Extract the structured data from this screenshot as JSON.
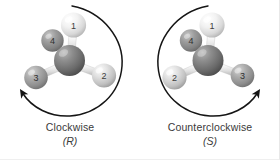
{
  "figure": {
    "background_color": "#ffffff",
    "width": 280,
    "height": 160
  },
  "panels": [
    {
      "id": "R",
      "caption_main": "Clockwise",
      "caption_sub": "(R)",
      "arrow_direction": "clockwise",
      "center_atom": {
        "label": "",
        "color": "#6e6e6e"
      },
      "substituents": [
        {
          "label": "1",
          "position": "top",
          "color": "#e2e2e2"
        },
        {
          "label": "2",
          "position": "lower-right",
          "color": "#c9c9c9"
        },
        {
          "label": "3",
          "position": "lower-left",
          "color": "#9a9a9a"
        },
        {
          "label": "4",
          "position": "upper-left-back",
          "color": "#8c8c8c"
        }
      ]
    },
    {
      "id": "S",
      "caption_main": "Counterclockwise",
      "caption_sub": "(S)",
      "arrow_direction": "counterclockwise",
      "center_atom": {
        "label": "",
        "color": "#6e6e6e"
      },
      "substituents": [
        {
          "label": "1",
          "position": "top",
          "color": "#e2e2e2"
        },
        {
          "label": "2",
          "position": "lower-left",
          "color": "#c9c9c9"
        },
        {
          "label": "3",
          "position": "lower-right",
          "color": "#9a9a9a"
        },
        {
          "label": "4",
          "position": "upper-left-back",
          "color": "#8c8c8c"
        }
      ]
    }
  ],
  "colors": {
    "arrow": "#151515",
    "bond": "#d4d4d4",
    "bond_edge": "#a8a8a8",
    "text": "#3a3a3a",
    "label_text": "#3c3c3c"
  },
  "labels": {
    "r_atom_1": "1",
    "r_atom_2": "2",
    "r_atom_3": "3",
    "r_atom_4": "4",
    "s_atom_1": "1",
    "s_atom_2": "2",
    "s_atom_3": "3",
    "s_atom_4": "4"
  }
}
